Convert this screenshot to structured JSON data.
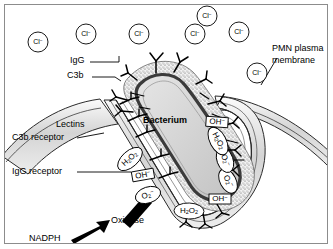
{
  "figure": {
    "border_color": "#8c8c8c",
    "background": "#ffffff",
    "ink_color": "#000000",
    "membrane_fill": "#d9d9d9",
    "capsule_fill": "#e8e8e8",
    "bacterium_fill": "#d2d2d2",
    "bacterium_wall_color": "#4a4a4a"
  },
  "labels": {
    "igg": "IgG",
    "c3b": "C3b",
    "bacterium": "Bacterium",
    "pmn_membrane_line1": "PMN plasma",
    "pmn_membrane_line2": "membrane",
    "lectins": "Lectins",
    "c3b_receptor": "C3b receptor",
    "igg_receptor": "IgG receptor",
    "oxidase": "Oxidase",
    "nadph": "NADPH"
  },
  "chloride_ions": [
    {
      "id": "cl-1",
      "label": "Cl",
      "charge": "−",
      "x": 38,
      "y": 42,
      "r": 10
    },
    {
      "id": "cl-2",
      "label": "Cl",
      "charge": "−",
      "x": 86,
      "y": 34,
      "r": 10
    },
    {
      "id": "cl-3",
      "label": "Cl",
      "charge": "−",
      "x": 139,
      "y": 34,
      "r": 10
    },
    {
      "id": "cl-4",
      "label": "Cl",
      "charge": "−",
      "x": 195,
      "y": 34,
      "r": 10
    },
    {
      "id": "cl-5",
      "label": "Cl",
      "charge": "−",
      "x": 207,
      "y": 16,
      "r": 10
    },
    {
      "id": "cl-6",
      "label": "Cl",
      "charge": "−",
      "x": 239,
      "y": 32,
      "r": 10
    },
    {
      "id": "cl-7",
      "label": "Cl",
      "charge": "−",
      "x": 257,
      "y": 73,
      "r": 10
    }
  ],
  "species": [
    {
      "id": "h2o2-left",
      "name": "hydrogen-peroxide",
      "formula": "H2O2",
      "shape": "oval",
      "x": 130,
      "y": 159,
      "rx": 15,
      "ry": 8,
      "rot": -42
    },
    {
      "id": "oh-left",
      "name": "hydroxyl-radical",
      "formula": "OH−",
      "shape": "box",
      "x": 143,
      "y": 175,
      "w": 22,
      "h": 10,
      "rot": -10
    },
    {
      "id": "o2-left",
      "name": "superoxide",
      "formula": "O2−",
      "shape": "oval",
      "x": 148,
      "y": 195,
      "rx": 13,
      "ry": 8,
      "rot": -18
    },
    {
      "id": "h2o2-bottom",
      "name": "hydrogen-peroxide",
      "formula": "H2O2",
      "shape": "oval",
      "x": 189,
      "y": 211,
      "rx": 15,
      "ry": 8,
      "rot": 2
    },
    {
      "id": "oh-bottom",
      "name": "hydroxyl-radical",
      "formula": "OH−",
      "shape": "box",
      "x": 220,
      "y": 199,
      "w": 22,
      "h": 10,
      "rot": 0
    },
    {
      "id": "o2-right-lo",
      "name": "superoxide",
      "formula": "O2−",
      "shape": "oval",
      "x": 228,
      "y": 181,
      "rx": 13,
      "ry": 8,
      "rot": 62
    },
    {
      "id": "o2-right-hi",
      "name": "superoxide",
      "formula": "O2−",
      "shape": "oval",
      "x": 225,
      "y": 160,
      "rx": 13,
      "ry": 8,
      "rot": 70
    },
    {
      "id": "h2o2-right",
      "name": "hydrogen-peroxide",
      "formula": "H2O2",
      "shape": "oval",
      "x": 218,
      "y": 141,
      "rx": 15,
      "ry": 8,
      "rot": 62
    },
    {
      "id": "oh-right",
      "name": "hydroxyl-radical",
      "formula": "OH−",
      "shape": "box",
      "x": 217,
      "y": 122,
      "w": 22,
      "h": 10,
      "rot": 4
    }
  ],
  "formulas": {
    "H2O2": {
      "parts": [
        {
          "t": "H",
          "k": "n"
        },
        {
          "t": "2",
          "k": "sub"
        },
        {
          "t": "O",
          "k": "n"
        },
        {
          "t": "2",
          "k": "sub"
        }
      ]
    },
    "OH-": {
      "parts": [
        {
          "t": "OH",
          "k": "n"
        },
        {
          "t": "−",
          "k": "sup"
        }
      ]
    },
    "O2-": {
      "parts": [
        {
          "t": "O",
          "k": "n"
        },
        {
          "t": "2",
          "k": "sub"
        },
        {
          "t": "−",
          "k": "sup"
        }
      ]
    }
  }
}
